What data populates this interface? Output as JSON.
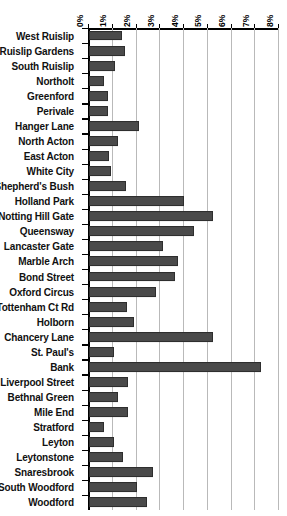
{
  "chart_data": {
    "type": "bar",
    "orientation": "horizontal",
    "title": "",
    "subtitle": "",
    "xlabel": "",
    "ylabel": "",
    "xlim": [
      0,
      8
    ],
    "ylim": null,
    "grid": true,
    "legend": null,
    "legend_position": "none",
    "x_unit": "%",
    "x_tick_labels": [
      "0%",
      "1%",
      "2%",
      "3%",
      "4%",
      "5%",
      "6%",
      "7%",
      "8%"
    ],
    "x_ticks": [
      0,
      1,
      2,
      3,
      4,
      5,
      6,
      7,
      8
    ],
    "categories": [
      "West Ruislip",
      "Ruislip Gardens",
      "South Ruislip",
      "Northolt",
      "Greenford",
      "Perivale",
      "Hanger Lane",
      "North Acton",
      "East Acton",
      "White City",
      "Shepherd's Bush",
      "Holland Park",
      "Notting Hill Gate",
      "Queensway",
      "Lancaster Gate",
      "Marble Arch",
      "Bond Street",
      "Oxford Circus",
      "Tottenham Ct Rd",
      "Holborn",
      "Chancery Lane",
      "St. Paul's",
      "Bank",
      "Liverpool Street",
      "Bethnal Green",
      "Mile End",
      "Stratford",
      "Leyton",
      "Leytonstone",
      "Snaresbrook",
      "South Woodford",
      "Woodford"
    ],
    "values": [
      1.4,
      1.5,
      1.1,
      0.65,
      0.8,
      0.8,
      2.1,
      1.2,
      0.85,
      0.92,
      1.55,
      4.0,
      5.2,
      4.4,
      3.1,
      3.75,
      3.6,
      2.8,
      1.6,
      1.9,
      5.2,
      1.05,
      7.25,
      1.65,
      1.2,
      1.65,
      0.65,
      1.05,
      1.45,
      2.7,
      2.0,
      2.45
    ],
    "bar_color": "#4a4a4a",
    "bar_edge_color": "#2e2e2e",
    "gridline_color": "#b9b9b9",
    "axis_color": "#000000",
    "background_color": "#ffffff"
  }
}
